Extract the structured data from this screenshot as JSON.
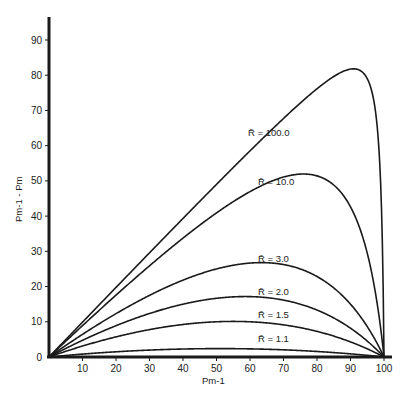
{
  "chart_data": {
    "type": "line",
    "title": "",
    "xlabel": "Pm-1",
    "ylabel": "Pm-1 - Pm",
    "xlim": [
      0,
      100
    ],
    "ylim": [
      0,
      95
    ],
    "grid": false,
    "legend": "inline labels on curves",
    "x_ticks": [
      10,
      20,
      30,
      40,
      50,
      60,
      70,
      80,
      90,
      100
    ],
    "y_ticks": [
      0,
      10,
      20,
      30,
      40,
      50,
      60,
      70,
      80,
      90
    ],
    "x": [
      0,
      10,
      20,
      30,
      40,
      50,
      60,
      70,
      80,
      90,
      95,
      100
    ],
    "series": [
      {
        "name": "R̄ = 1.1",
        "label": "R̄ = 1.1",
        "R": 1.1,
        "values": [
          0,
          0.8,
          1.5,
          2.0,
          2.3,
          2.4,
          2.3,
          2.0,
          1.5,
          0.8,
          0.4,
          0
        ],
        "peak": {
          "x": 51,
          "y": 2.4
        }
      },
      {
        "name": "R̄ = 1.5",
        "label": "R̄ = 1.5",
        "R": 1.5,
        "values": [
          0,
          3.1,
          5.7,
          7.6,
          8.6,
          10.0,
          9.6,
          8.8,
          7.3,
          4.6,
          2.5,
          0
        ],
        "peak": {
          "x": 55,
          "y": 10.1
        }
      },
      {
        "name": "R̄ = 2.0",
        "label": "R̄ = 2.0",
        "R": 2.0,
        "values": [
          0,
          4.7,
          8.9,
          12.4,
          15.0,
          16.7,
          17.1,
          16.2,
          13.3,
          8.2,
          4.5,
          0
        ],
        "peak": {
          "x": 59,
          "y": 17.2
        }
      },
      {
        "name": "R̄ = 3.0",
        "label": "R̄ = 3.0",
        "R": 3.0,
        "values": [
          0,
          6.9,
          12.7,
          18.1,
          22.3,
          25.0,
          26.3,
          26.2,
          22.9,
          15.0,
          8.6,
          0
        ],
        "peak": {
          "x": 63,
          "y": 26.8
        }
      },
      {
        "name": "R̄ = 10.0",
        "label": "R̄ = 10.0",
        "R": 10.0,
        "values": [
          0,
          8.9,
          17.1,
          25.1,
          33.0,
          40.9,
          46.8,
          49.7,
          49.0,
          40.9,
          29.3,
          0
        ],
        "peak": {
          "x": 76,
          "y": 50.0
        }
      },
      {
        "name": "R̄ = 100.0",
        "label": "R̄ = 100.0",
        "R": 100.0,
        "values": [
          0,
          9.9,
          19.8,
          29.9,
          39.9,
          49.8,
          59.8,
          69.8,
          79.2,
          81.0,
          78.4,
          0
        ],
        "peak": {
          "x": 91,
          "y": 81.0
        }
      }
    ],
    "formula": "Pm-1 - Pm = p - 100p / (p + R̄(100 - p))"
  },
  "labels": {
    "x_axis_title": "Pm-1",
    "y_axis_title": "Pm-1 - Pm"
  },
  "colors": {
    "ink": "#1a1a1a",
    "background": "#ffffff"
  },
  "layout": {
    "x0_px": 49,
    "x100_px": 384,
    "y0_px": 357,
    "y90_px": 40,
    "label_positions": [
      {
        "series": 0,
        "px": 258,
        "py": 342
      },
      {
        "series": 1,
        "px": 258,
        "py": 318
      },
      {
        "series": 2,
        "px": 258,
        "py": 295
      },
      {
        "series": 3,
        "px": 258,
        "py": 262
      },
      {
        "series": 4,
        "px": 258,
        "py": 185
      },
      {
        "series": 5,
        "px": 248,
        "py": 136
      }
    ]
  }
}
